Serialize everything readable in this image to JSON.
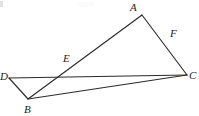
{
  "figure": {
    "kind": "plane-geometry-diagram",
    "width": 199,
    "height": 116,
    "background_color": "#ffffff",
    "stroke_color": "#2b2b2b",
    "label_color": "#1c1c1c",
    "points": [
      {
        "id": "A",
        "label": "A",
        "x": 142,
        "y": 15,
        "label_x": 130,
        "label_y": 11,
        "role": "apex-vertex"
      },
      {
        "id": "B",
        "label": "B",
        "x": 28,
        "y": 99,
        "label_x": 24,
        "label_y": 113,
        "role": "lower-left-vertex"
      },
      {
        "id": "C",
        "label": "C",
        "x": 187,
        "y": 75,
        "label_x": 189,
        "label_y": 79,
        "role": "right-vertex"
      },
      {
        "id": "D",
        "label": "D",
        "x": 9,
        "y": 78,
        "label_x": 0,
        "label_y": 80,
        "role": "left-vertex"
      },
      {
        "id": "E",
        "label": "E",
        "x": 71,
        "y": 68,
        "label_x": 63,
        "label_y": 62,
        "role": "intersection-of-AB-and-DC"
      },
      {
        "id": "F",
        "label": "F",
        "x": 169,
        "y": 41,
        "label_x": 170,
        "label_y": 37,
        "role": "intersection-of-AC-and-DC"
      }
    ],
    "segments": [
      {
        "id": "AB",
        "from": "A",
        "to": "B",
        "through": [
          "E"
        ],
        "d": "M142,15 L28,99"
      },
      {
        "id": "AC",
        "from": "A",
        "to": "C",
        "through": [
          "F"
        ],
        "d": "M142,15 L187,75"
      },
      {
        "id": "DC",
        "from": "D",
        "to": "C",
        "through": [
          "E",
          "F"
        ],
        "d": "M9,78 L187,75"
      },
      {
        "id": "DB",
        "from": "D",
        "to": "B",
        "through": [],
        "d": "M9,78 L28,99"
      },
      {
        "id": "BC",
        "from": "B",
        "to": "C",
        "through": [],
        "d": "M28,99 L187,75"
      }
    ],
    "artifacts": {
      "top_left_mark_color": "#d8d8d8",
      "top_center_smudge_color": "#fbfbfb"
    }
  }
}
